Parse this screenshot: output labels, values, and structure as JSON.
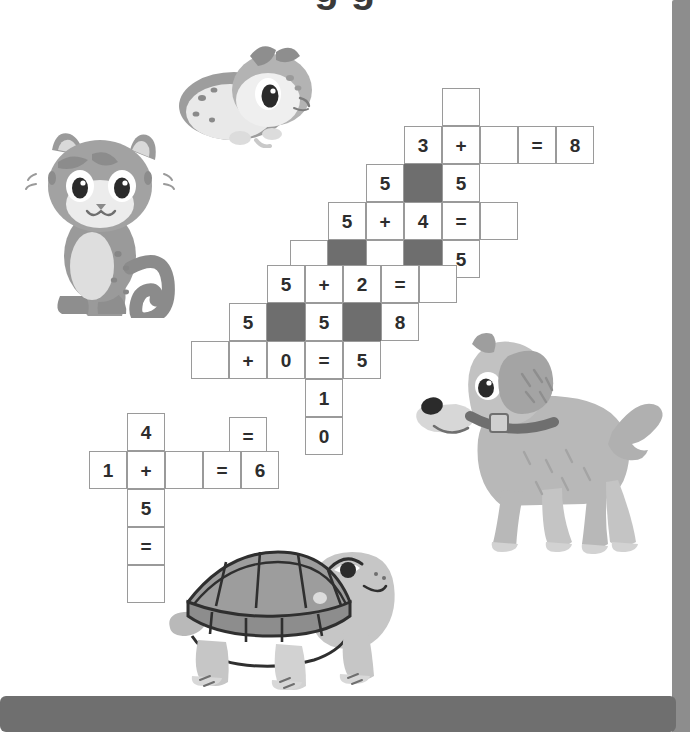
{
  "page": {
    "title_partial": "g   g",
    "background_color": "#ffffff",
    "edge_strip_color": "#8d8d8d",
    "bottom_bar_color": "#6f6f6f"
  },
  "puzzle": {
    "cell_size": 38,
    "blocked_color": "#6e6e6e",
    "cell_border_color": "#9a9a9a",
    "text_color": "#2d2d2d",
    "cells": [
      {
        "name": "cell-r0c0",
        "x": 442,
        "y": 88,
        "text": "",
        "blocked": false
      },
      {
        "name": "cell-r1c0",
        "x": 404,
        "y": 126,
        "text": "3",
        "blocked": false
      },
      {
        "name": "cell-r1c1",
        "x": 442,
        "y": 126,
        "text": "+",
        "blocked": false
      },
      {
        "name": "cell-r1c2",
        "x": 480,
        "y": 126,
        "text": "",
        "blocked": false
      },
      {
        "name": "cell-r1c3",
        "x": 518,
        "y": 126,
        "text": "=",
        "blocked": false
      },
      {
        "name": "cell-r1c4",
        "x": 556,
        "y": 126,
        "text": "8",
        "blocked": false
      },
      {
        "name": "cell-r2c0",
        "x": 366,
        "y": 164,
        "text": "5",
        "blocked": false
      },
      {
        "name": "cell-r2c1",
        "x": 404,
        "y": 164,
        "text": "",
        "blocked": true
      },
      {
        "name": "cell-r2c2",
        "x": 442,
        "y": 164,
        "text": "5",
        "blocked": false
      },
      {
        "name": "cell-r3c0",
        "x": 328,
        "y": 202,
        "text": "5",
        "blocked": false
      },
      {
        "name": "cell-r3c1",
        "x": 366,
        "y": 202,
        "text": "+",
        "blocked": false
      },
      {
        "name": "cell-r3c2",
        "x": 404,
        "y": 202,
        "text": "4",
        "blocked": false
      },
      {
        "name": "cell-r3c3",
        "x": 442,
        "y": 202,
        "text": "=",
        "blocked": false
      },
      {
        "name": "cell-r3c4",
        "x": 480,
        "y": 202,
        "text": "",
        "blocked": false
      },
      {
        "name": "cell-r4c0",
        "x": 290,
        "y": 240,
        "text": "",
        "blocked": false
      },
      {
        "name": "cell-r4c1",
        "x": 328,
        "y": 240,
        "text": "",
        "blocked": true
      },
      {
        "name": "cell-r4c2",
        "x": 366,
        "y": 240,
        "text": "",
        "blocked": false
      },
      {
        "name": "cell-r4c3",
        "x": 404,
        "y": 240,
        "text": "",
        "blocked": true
      },
      {
        "name": "cell-r4c4",
        "x": 442,
        "y": 240,
        "text": "5",
        "blocked": false
      },
      {
        "name": "cell-r5c0",
        "x": 267,
        "y": 265,
        "text": "5",
        "blocked": false
      },
      {
        "name": "cell-r5c1",
        "x": 305,
        "y": 265,
        "text": "+",
        "blocked": false
      },
      {
        "name": "cell-r5c2",
        "x": 343,
        "y": 265,
        "text": "2",
        "blocked": false
      },
      {
        "name": "cell-r5c3",
        "x": 381,
        "y": 265,
        "text": "=",
        "blocked": false
      },
      {
        "name": "cell-r5c4",
        "x": 419,
        "y": 265,
        "text": "",
        "blocked": false
      },
      {
        "name": "cell-r6c0",
        "x": 229,
        "y": 303,
        "text": "5",
        "blocked": false
      },
      {
        "name": "cell-r6c1",
        "x": 267,
        "y": 303,
        "text": "",
        "blocked": true
      },
      {
        "name": "cell-r6c2",
        "x": 305,
        "y": 303,
        "text": "5",
        "blocked": false
      },
      {
        "name": "cell-r6c3",
        "x": 343,
        "y": 303,
        "text": "",
        "blocked": true
      },
      {
        "name": "cell-r6c4",
        "x": 381,
        "y": 303,
        "text": "8",
        "blocked": false
      },
      {
        "name": "cell-r7c0",
        "x": 191,
        "y": 341,
        "text": "",
        "blocked": false
      },
      {
        "name": "cell-r7c1",
        "x": 229,
        "y": 341,
        "text": "+",
        "blocked": false
      },
      {
        "name": "cell-r7c2",
        "x": 267,
        "y": 341,
        "text": "0",
        "blocked": false
      },
      {
        "name": "cell-r7c3",
        "x": 305,
        "y": 341,
        "text": "=",
        "blocked": false
      },
      {
        "name": "cell-r7c4",
        "x": 343,
        "y": 341,
        "text": "5",
        "blocked": false
      },
      {
        "name": "cell-r8c0",
        "x": 305,
        "y": 379,
        "text": "1",
        "blocked": false
      },
      {
        "name": "cell-r9c0",
        "x": 229,
        "y": 417,
        "text": "=",
        "blocked": false
      },
      {
        "name": "cell-r9c1",
        "x": 305,
        "y": 417,
        "text": "0",
        "blocked": false
      },
      {
        "name": "cell-l0c0",
        "x": 127,
        "y": 413,
        "text": "4",
        "blocked": false
      },
      {
        "name": "cell-l1c0",
        "x": 89,
        "y": 451,
        "text": "1",
        "blocked": false
      },
      {
        "name": "cell-l1c1",
        "x": 127,
        "y": 451,
        "text": "+",
        "blocked": false
      },
      {
        "name": "cell-l1c2",
        "x": 165,
        "y": 451,
        "text": "",
        "blocked": false
      },
      {
        "name": "cell-l1c3",
        "x": 203,
        "y": 451,
        "text": "=",
        "blocked": false
      },
      {
        "name": "cell-l1c4",
        "x": 241,
        "y": 451,
        "text": "6",
        "blocked": false
      },
      {
        "name": "cell-l2c0",
        "x": 127,
        "y": 489,
        "text": "5",
        "blocked": false
      },
      {
        "name": "cell-l3c0",
        "x": 127,
        "y": 527,
        "text": "=",
        "blocked": false
      },
      {
        "name": "cell-l4c0",
        "x": 127,
        "y": 565,
        "text": "",
        "blocked": false
      }
    ]
  },
  "illustrations": [
    {
      "name": "hamster-illustration",
      "label": "hamster",
      "x": 172,
      "y": 28,
      "w": 150,
      "h": 120
    },
    {
      "name": "cat-illustration",
      "label": "cat",
      "x": 22,
      "y": 128,
      "w": 165,
      "h": 190
    },
    {
      "name": "dog-illustration",
      "label": "dog",
      "x": 412,
      "y": 330,
      "w": 258,
      "h": 230
    },
    {
      "name": "turtle-illustration",
      "label": "turtle",
      "x": 168,
      "y": 540,
      "w": 235,
      "h": 162
    }
  ]
}
